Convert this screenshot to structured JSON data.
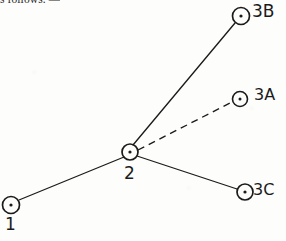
{
  "page": {
    "kind": "scanned-handwritten-diagram",
    "width": 286,
    "height": 241,
    "background_color": "#fdfdfc",
    "ink_color": "#1b1b1b"
  },
  "printed_text": {
    "fragment": "s follows. —"
  },
  "diagram": {
    "nodes": [
      {
        "id": "1",
        "label": "1",
        "cx": 11,
        "cy": 205,
        "r": 8.5,
        "dot_r": 1.6,
        "label_x": 5,
        "label_y": 214,
        "label_position": "below"
      },
      {
        "id": "2",
        "label": "2",
        "cx": 130,
        "cy": 152,
        "r": 8.0,
        "dot_r": 1.6,
        "label_x": 124,
        "label_y": 163,
        "label_position": "below"
      },
      {
        "id": "3A",
        "label": "3A",
        "cx": 240,
        "cy": 99,
        "r": 7.5,
        "dot_r": 1.5,
        "label_x": 254,
        "label_y": 85,
        "label_position": "right"
      },
      {
        "id": "3B",
        "label": "3B",
        "cx": 241,
        "cy": 16,
        "r": 8.5,
        "dot_r": 1.6,
        "label_x": 252,
        "label_y": 1,
        "label_position": "right"
      },
      {
        "id": "3C",
        "label": "3C",
        "cx": 245,
        "cy": 192,
        "r": 8.0,
        "dot_r": 1.6,
        "label_x": 253,
        "label_y": 180,
        "label_position": "right"
      }
    ],
    "edges": [
      {
        "id": "edge-1-2",
        "from": "1",
        "to": "2",
        "style": "solid",
        "x1": 19,
        "y1": 200,
        "x2": 124,
        "y2": 157
      },
      {
        "id": "edge-2-3B",
        "from": "2",
        "to": "3B",
        "style": "solid",
        "x1": 133,
        "y1": 145,
        "x2": 235,
        "y2": 23
      },
      {
        "id": "edge-2-3A",
        "from": "2",
        "to": "3A",
        "style": "dashed",
        "x1": 138,
        "y1": 150,
        "x2": 232,
        "y2": 102,
        "dash_pattern": "7 5"
      },
      {
        "id": "edge-2-3C",
        "from": "2",
        "to": "3C",
        "style": "solid",
        "x1": 137,
        "y1": 156,
        "x2": 237,
        "y2": 189
      }
    ],
    "stroke_width": 1.25
  }
}
